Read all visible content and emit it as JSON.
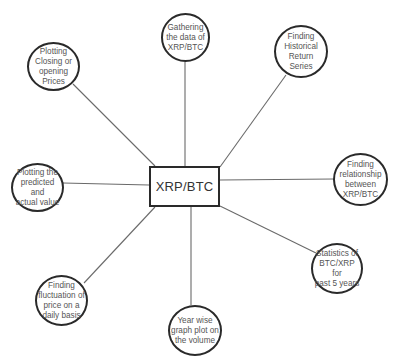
{
  "diagram": {
    "type": "mind-map",
    "center": {
      "label": "XRP/BTC"
    },
    "nodes": [
      {
        "id": "gathering",
        "label": "Gathering\nthe data of\nXRP/BTC"
      },
      {
        "id": "historical",
        "label": "Finding\nHistorical\nReturn\nSeries"
      },
      {
        "id": "relationship",
        "label": "Finding\nrelationship\nbetween\nXRP/BTC"
      },
      {
        "id": "statistics",
        "label": "Statistics of\nBTC/XRP for\npast 5 years"
      },
      {
        "id": "yearwise",
        "label": "Year wise\ngraph plot on\nthe volume"
      },
      {
        "id": "fluctuation",
        "label": "Finding\nfluctuation of\nprice on a\ndaily basis"
      },
      {
        "id": "predicted",
        "label": "Plotting the\npredicted and\nactual value"
      },
      {
        "id": "closing",
        "label": "Plotting\nClosing or\nopening\nPrices"
      }
    ],
    "colors": {
      "stroke": "#2a2a2a",
      "connector": "#6a6a6a",
      "text": "#555555",
      "background": "#ffffff"
    }
  }
}
